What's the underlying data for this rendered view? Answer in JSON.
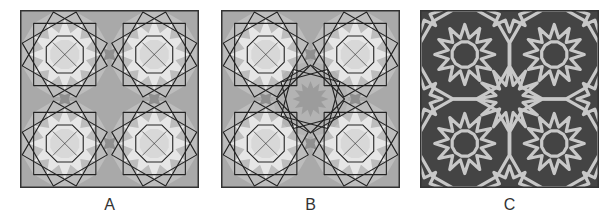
{
  "figure": {
    "panels": [
      {
        "id": "A",
        "label": "A",
        "description": "Overlaid construction lines on grey background with four light rosettes",
        "background": "#a9a9a9",
        "rosette_fill": "#e6e6e6",
        "line_color": "#222222",
        "center_type": "gap"
      },
      {
        "id": "B",
        "label": "B",
        "description": "Overlaid construction lines with four light rosettes plus a central 12-point star",
        "background": "#a9a9a9",
        "rosette_fill": "#e6e6e6",
        "line_color": "#222222",
        "center_type": "star"
      },
      {
        "id": "C",
        "label": "C",
        "description": "Final interlaced strapwork pattern, light bands on dark background",
        "background": "#444444",
        "band_color": "#c8c8c8"
      }
    ]
  }
}
